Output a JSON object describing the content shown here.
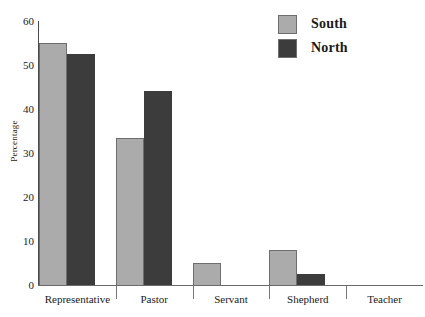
{
  "chart_data": {
    "type": "bar",
    "title": "",
    "xlabel": "",
    "ylabel": "Percentage",
    "ylim": [
      0,
      60
    ],
    "yticks": [
      "0",
      "10",
      "20",
      "30",
      "40",
      "50",
      "60"
    ],
    "grid": false,
    "legend_position": "top-right",
    "categories": [
      "Representative",
      "Pastor",
      "Servant",
      "Shepherd",
      "Teacher"
    ],
    "series": [
      {
        "name": "South",
        "color": "#ababab",
        "values": [
          55,
          33.5,
          5,
          8,
          0
        ]
      },
      {
        "name": "North",
        "color": "#3c3c3c",
        "values": [
          52.5,
          44,
          0,
          2.5,
          0
        ]
      }
    ]
  },
  "legend": {
    "items": [
      {
        "label": "South",
        "color": "#ababab"
      },
      {
        "label": "North",
        "color": "#3c3c3c"
      }
    ]
  },
  "axes": {
    "y_title": "Percentage",
    "y_ticks": [
      "60",
      "50",
      "40",
      "30",
      "20",
      "10",
      "0"
    ],
    "x_categories": [
      "Representative",
      "Pastor",
      "Servant",
      "Shepherd",
      "Teacher"
    ]
  }
}
